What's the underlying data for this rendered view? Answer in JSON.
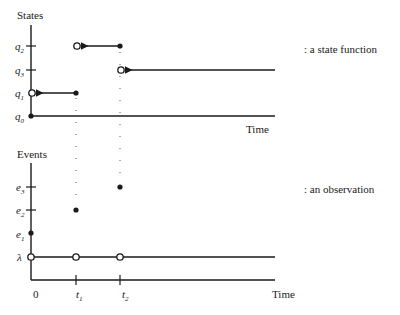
{
  "states_panel": {
    "title": "States",
    "annotation": ": a state function",
    "axis_label": "Time",
    "levels": [
      {
        "name": "q",
        "sub": "2"
      },
      {
        "name": "q",
        "sub": "3"
      },
      {
        "name": "q",
        "sub": "1"
      },
      {
        "name": "q",
        "sub": "0"
      }
    ]
  },
  "events_panel": {
    "title": "Events",
    "annotation": ": an observation",
    "axis_label": "Time",
    "levels": [
      {
        "name": "e",
        "sub": "3"
      },
      {
        "name": "e",
        "sub": "2"
      },
      {
        "name": "e",
        "sub": "1"
      },
      {
        "name": "λ",
        "sub": ""
      }
    ],
    "time_ticks": [
      {
        "name": "0",
        "sub": ""
      },
      {
        "name": "t",
        "sub": "1"
      },
      {
        "name": "t",
        "sub": "2"
      }
    ]
  },
  "colors": {
    "ink": "#1a1a1a",
    "dots": "#555555",
    "background": "#ffffff"
  }
}
